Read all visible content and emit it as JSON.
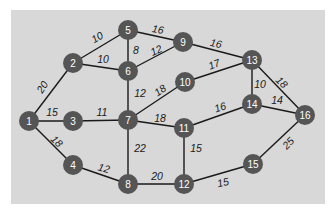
{
  "diagram": {
    "type": "weighted-undirected-graph",
    "colors": {
      "background": "#d8d8d8",
      "node_fill": "#555555",
      "node_text": "#ffffff",
      "edge": "#1a1a1a",
      "label": "#1a1a1a"
    },
    "nodes": [
      {
        "id": "1",
        "label": "1",
        "x": 29,
        "y": 121
      },
      {
        "id": "2",
        "label": "2",
        "x": 73,
        "y": 63
      },
      {
        "id": "3",
        "label": "3",
        "x": 73,
        "y": 121
      },
      {
        "id": "4",
        "label": "4",
        "x": 73,
        "y": 165
      },
      {
        "id": "5",
        "label": "5",
        "x": 128,
        "y": 30
      },
      {
        "id": "6",
        "label": "6",
        "x": 128,
        "y": 71
      },
      {
        "id": "7",
        "label": "7",
        "x": 128,
        "y": 120
      },
      {
        "id": "8",
        "label": "8",
        "x": 128,
        "y": 184
      },
      {
        "id": "9",
        "label": "9",
        "x": 183,
        "y": 42
      },
      {
        "id": "10",
        "label": "10",
        "x": 185,
        "y": 82
      },
      {
        "id": "11",
        "label": "11",
        "x": 184,
        "y": 128
      },
      {
        "id": "12",
        "label": "12",
        "x": 184,
        "y": 184
      },
      {
        "id": "13",
        "label": "13",
        "x": 252,
        "y": 60
      },
      {
        "id": "14",
        "label": "14",
        "x": 252,
        "y": 104
      },
      {
        "id": "15",
        "label": "15",
        "x": 253,
        "y": 164
      },
      {
        "id": "16",
        "label": "16",
        "x": 305,
        "y": 115
      }
    ],
    "edges": [
      {
        "from": "1",
        "to": "2",
        "weight": "20",
        "lx": 42,
        "ly": 87,
        "rot": -58
      },
      {
        "from": "1",
        "to": "3",
        "weight": "15",
        "lx": 52,
        "ly": 112,
        "rot": 0
      },
      {
        "from": "1",
        "to": "4",
        "weight": "18",
        "lx": 57,
        "ly": 141,
        "rot": 45
      },
      {
        "from": "2",
        "to": "5",
        "weight": "10",
        "lx": 97,
        "ly": 37,
        "rot": -30
      },
      {
        "from": "2",
        "to": "6",
        "weight": "10",
        "lx": 103,
        "ly": 59,
        "rot": 0
      },
      {
        "from": "3",
        "to": "7",
        "weight": "11",
        "lx": 102,
        "ly": 112,
        "rot": 0
      },
      {
        "from": "4",
        "to": "8",
        "weight": "12",
        "lx": 104,
        "ly": 168,
        "rot": 15
      },
      {
        "from": "5",
        "to": "6",
        "weight": "8",
        "lx": 136,
        "ly": 50,
        "rot": 0
      },
      {
        "from": "5",
        "to": "9",
        "weight": "16",
        "lx": 158,
        "ly": 29,
        "rot": 10
      },
      {
        "from": "6",
        "to": "9",
        "weight": "12",
        "lx": 156,
        "ly": 50,
        "rot": -25
      },
      {
        "from": "6",
        "to": "7",
        "weight": "12",
        "lx": 140,
        "ly": 93,
        "rot": 0
      },
      {
        "from": "7",
        "to": "10",
        "weight": "18",
        "lx": 160,
        "ly": 90,
        "rot": -35
      },
      {
        "from": "7",
        "to": "11",
        "weight": "18",
        "lx": 160,
        "ly": 118,
        "rot": 0
      },
      {
        "from": "7",
        "to": "8",
        "weight": "22",
        "lx": 140,
        "ly": 148,
        "rot": 0
      },
      {
        "from": "8",
        "to": "12",
        "weight": "20",
        "lx": 157,
        "ly": 176,
        "rot": 0
      },
      {
        "from": "9",
        "to": "13",
        "weight": "16",
        "lx": 216,
        "ly": 43,
        "rot": 12
      },
      {
        "from": "10",
        "to": "13",
        "weight": "17",
        "lx": 214,
        "ly": 64,
        "rot": -20
      },
      {
        "from": "11",
        "to": "14",
        "weight": "16",
        "lx": 220,
        "ly": 107,
        "rot": -18
      },
      {
        "from": "11",
        "to": "12",
        "weight": "15",
        "lx": 196,
        "ly": 148,
        "rot": 0
      },
      {
        "from": "12",
        "to": "15",
        "weight": "15",
        "lx": 223,
        "ly": 182,
        "rot": -12
      },
      {
        "from": "13",
        "to": "14",
        "weight": "10",
        "lx": 260,
        "ly": 84,
        "rot": 0
      },
      {
        "from": "13",
        "to": "16",
        "weight": "18",
        "lx": 282,
        "ly": 82,
        "rot": 45
      },
      {
        "from": "14",
        "to": "16",
        "weight": "14",
        "lx": 277,
        "ly": 100,
        "rot": 0
      },
      {
        "from": "15",
        "to": "16",
        "weight": "25",
        "lx": 288,
        "ly": 143,
        "rot": -45
      }
    ]
  }
}
